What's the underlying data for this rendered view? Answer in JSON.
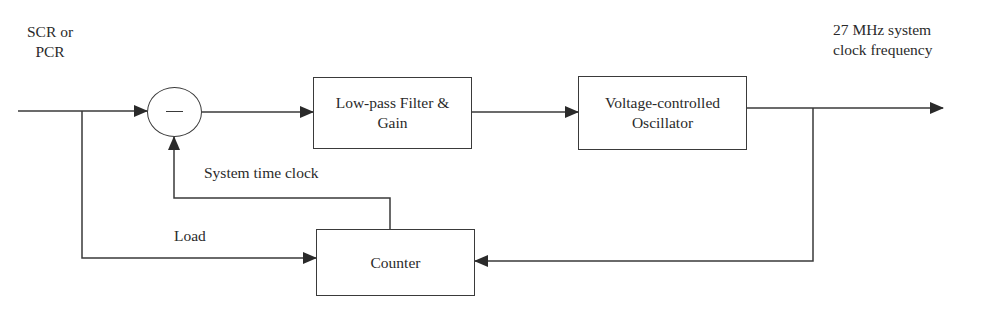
{
  "diagram": {
    "input_label": "SCR or\nPCR",
    "output_label": "27 MHz system\nclock frequency",
    "summing_junction": {
      "symbol": "minus-sign",
      "operation": "subtract"
    },
    "blocks": [
      {
        "id": "lpf",
        "label": "Low-pass Filter &\nGain"
      },
      {
        "id": "vco",
        "label": "Voltage-controlled\nOscillator"
      },
      {
        "id": "counter",
        "label": "Counter"
      }
    ],
    "edge_labels": {
      "feedback": "System time clock",
      "load": "Load"
    },
    "edges": [
      {
        "from": "input",
        "to": "summing_junction"
      },
      {
        "from": "summing_junction",
        "to": "lpf"
      },
      {
        "from": "lpf",
        "to": "vco"
      },
      {
        "from": "vco",
        "to": "output"
      },
      {
        "from": "vco",
        "to": "counter"
      },
      {
        "from": "input",
        "to": "counter",
        "label": "Load"
      },
      {
        "from": "counter",
        "to": "summing_junction",
        "label": "System time clock"
      }
    ],
    "colors": {
      "stroke": "#3a3a3a",
      "text": "#2a2a2a",
      "background": "#ffffff"
    }
  }
}
